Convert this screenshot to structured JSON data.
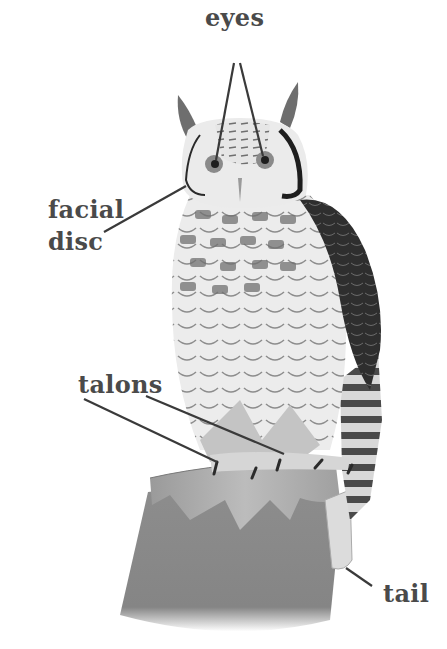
{
  "diagram": {
    "labels": {
      "eyes": "eyes",
      "facial_disc_line1": "facial",
      "facial_disc_line2": "disc",
      "talons": "talons",
      "tail": "tail"
    },
    "colors": {
      "label_text": "#4a4a4a",
      "leader_line": "#3a3a3a",
      "dark_wing": "#2e2e2e",
      "belly": "#ebebeb",
      "stump": "#8a8a8a",
      "stump_top": "#a8a8a8"
    }
  }
}
